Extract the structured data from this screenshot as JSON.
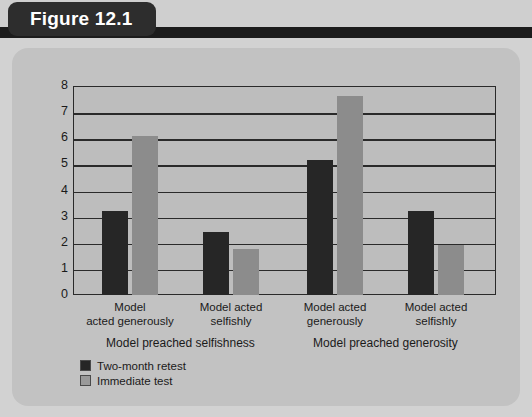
{
  "figure": {
    "tab_label": "Figure 12.1"
  },
  "chart_data": {
    "type": "bar",
    "title": "",
    "xlabel": "",
    "ylabel": "Mean number of tokens donated",
    "ylim": [
      0,
      8
    ],
    "yticks": [
      8,
      7,
      6,
      5,
      4,
      3,
      2,
      1,
      0
    ],
    "grid": true,
    "legend_position": "bottom-left",
    "categories": [
      "Model acted generously",
      "Model acted selfishly",
      "Model acted generously",
      "Model acted selfishly"
    ],
    "groups": [
      {
        "label": "Model preached selfishness",
        "categories": [
          "Model acted generously",
          "Model acted selfishly"
        ]
      },
      {
        "label": "Model preached generosity",
        "categories": [
          "Model acted generously",
          "Model acted selfishly"
        ]
      }
    ],
    "series": [
      {
        "name": "Two-month retest",
        "color": "#262626",
        "values": [
          3.2,
          2.4,
          5.15,
          3.2
        ]
      },
      {
        "name": "Immediate test",
        "color": "#8c8c8c",
        "values": [
          6.1,
          1.75,
          7.6,
          1.9
        ]
      }
    ],
    "bars": [
      {
        "group": 0,
        "category": "Model acted generously",
        "series": "Two-month retest",
        "value": 3.2
      },
      {
        "group": 0,
        "category": "Model acted generously",
        "series": "Immediate test",
        "value": 6.1
      },
      {
        "group": 0,
        "category": "Model acted selfishly",
        "series": "Two-month retest",
        "value": 2.4
      },
      {
        "group": 0,
        "category": "Model acted selfishly",
        "series": "Immediate test",
        "value": 1.75
      },
      {
        "group": 1,
        "category": "Model acted generously",
        "series": "Two-month retest",
        "value": 5.15
      },
      {
        "group": 1,
        "category": "Model acted generously",
        "series": "Immediate test",
        "value": 7.6
      },
      {
        "group": 1,
        "category": "Model acted selfishly",
        "series": "Two-month retest",
        "value": 3.2
      },
      {
        "group": 1,
        "category": "Model acted selfishly",
        "series": "Immediate test",
        "value": 1.9
      }
    ],
    "legend": [
      {
        "label": "Two-month retest",
        "color": "#262626"
      },
      {
        "label": "Immediate test",
        "color": "#9a9a9a"
      }
    ]
  },
  "xlabels": [
    {
      "line1": "Model",
      "line2": "acted generously"
    },
    {
      "line1": "Model acted",
      "line2": "selfishly"
    },
    {
      "line1": "Model acted",
      "line2": "generously"
    },
    {
      "line1": "Model acted",
      "line2": "selfishly"
    }
  ],
  "colors": {
    "tab_background": "#2d2d2d",
    "header_bar": "#1c1c1c",
    "outer_panel": "#d2d2d2",
    "inner_panel": "#c2c2c2",
    "plot_background": "#bdbdbd",
    "axis": "#2a2a2a",
    "series_dark": "#262626",
    "series_light": "#8c8c8c"
  }
}
